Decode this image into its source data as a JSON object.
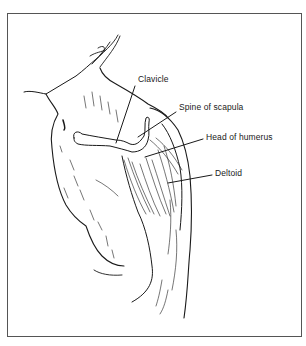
{
  "figure": {
    "labels": [
      {
        "id": "clavicle",
        "text": "Clavicle"
      },
      {
        "id": "spine",
        "text": "Spine of scapula"
      },
      {
        "id": "head",
        "text": "Head of humerus"
      },
      {
        "id": "deltoid",
        "text": "Deltoid"
      }
    ]
  },
  "colors": {
    "ink": "#1a1a1a",
    "frame": "#555555",
    "background": "#ffffff"
  }
}
